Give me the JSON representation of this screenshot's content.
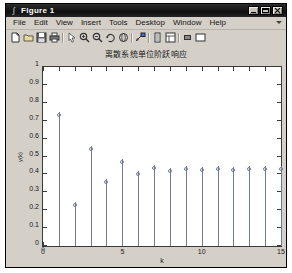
{
  "window": {
    "title": "Figure 1",
    "icon": "matlab-figure-icon",
    "buttons": {
      "minimize": "minimize",
      "maximize": "maximize",
      "close": "close"
    }
  },
  "menubar": {
    "items": [
      {
        "label": "File",
        "accel": "F"
      },
      {
        "label": "Edit",
        "accel": "E"
      },
      {
        "label": "View",
        "accel": "V"
      },
      {
        "label": "Insert",
        "accel": "I"
      },
      {
        "label": "Tools",
        "accel": "T"
      },
      {
        "label": "Desktop",
        "accel": "D"
      },
      {
        "label": "Window",
        "accel": "W"
      },
      {
        "label": "Help",
        "accel": "H"
      }
    ],
    "overflow": "chevron-down-icon"
  },
  "toolbar": {
    "items": [
      {
        "name": "new-figure-icon",
        "tip": "New Figure"
      },
      {
        "name": "open-file-icon",
        "tip": "Open File"
      },
      {
        "name": "save-figure-icon",
        "tip": "Save Figure"
      },
      {
        "name": "print-figure-icon",
        "tip": "Print Figure"
      },
      {
        "name": "separator"
      },
      {
        "name": "edit-plot-pointer-icon",
        "tip": "Edit Plot"
      },
      {
        "name": "zoom-in-icon",
        "tip": "Zoom In"
      },
      {
        "name": "zoom-out-icon",
        "tip": "Zoom Out"
      },
      {
        "name": "pan-rotate-icon",
        "tip": "Pan"
      },
      {
        "name": "rotate-3d-icon",
        "tip": "Rotate 3D"
      },
      {
        "name": "separator"
      },
      {
        "name": "data-cursor-icon",
        "tip": "Data Cursor"
      },
      {
        "name": "separator"
      },
      {
        "name": "insert-colorbar-icon",
        "tip": "Insert Colorbar"
      },
      {
        "name": "insert-legend-icon",
        "tip": "Insert Legend"
      },
      {
        "name": "separator"
      },
      {
        "name": "hide-plot-tools-icon",
        "tip": "Hide Plot Tools"
      },
      {
        "name": "show-plot-tools-icon",
        "tip": "Show Plot Tools"
      }
    ]
  },
  "chart_data": {
    "type": "stem",
    "title": "离散系统单位阶跃响应",
    "xlabel": "k",
    "ylabel": "y(k)",
    "xlim": [
      0,
      15
    ],
    "ylim": [
      0,
      1
    ],
    "xticks": [
      0,
      1,
      2,
      3,
      4,
      5,
      6,
      7,
      8,
      9,
      10,
      11,
      12,
      13,
      14,
      15
    ],
    "xticklabels": {
      "0": "0",
      "5": "5",
      "10": "10",
      "15": "15"
    },
    "yticks": [
      0,
      0.1,
      0.2,
      0.3,
      0.4,
      0.5,
      0.6,
      0.7,
      0.8,
      0.9,
      1
    ],
    "yticklabels": [
      "0",
      "0.1",
      "0.2",
      "0.3",
      "0.4",
      "0.5",
      "0.6",
      "0.7",
      "0.8",
      "0.9",
      "1"
    ],
    "grid": false,
    "legend": null,
    "marker": "circle-open",
    "line_color": "#6f7b93",
    "x": [
      0,
      1,
      2,
      3,
      4,
      5,
      6,
      7,
      8,
      9,
      10,
      11,
      12,
      13,
      14,
      15
    ],
    "values": [
      0.0,
      0.75,
      0.245,
      0.56,
      0.375,
      0.485,
      0.42,
      0.455,
      0.438,
      0.448,
      0.443,
      0.446,
      0.444,
      0.445,
      0.4445,
      0.4448
    ]
  },
  "colors": {
    "window_face": "#d4d0c8",
    "axes_background": "#ffffff",
    "axes_edge": "#3a3a3a",
    "titlebar": "#101010",
    "stem_color": "#6f7b93"
  }
}
